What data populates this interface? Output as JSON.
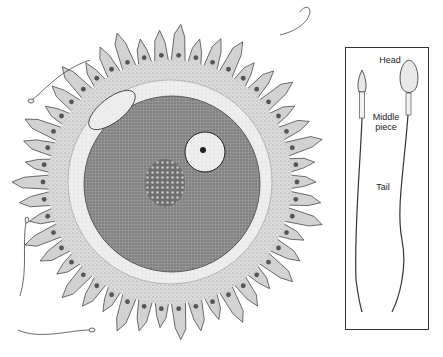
{
  "figure": {
    "inset": {
      "labels": {
        "head": "Head",
        "middle_piece": "Middle\npiece",
        "tail": "Tail"
      }
    }
  },
  "colors": {
    "background": "#ffffff",
    "line": "#333333",
    "corona": "#d6d6d6",
    "zona": "#eeeeee",
    "cytoplasm": "#8c8c8c",
    "nucleus": "#dcdcdc"
  }
}
